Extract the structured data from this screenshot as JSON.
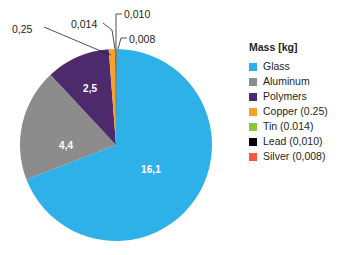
{
  "chart_data": {
    "type": "pie",
    "title": "",
    "legend_title": "Mass [kg]",
    "legend_position": "right",
    "units": "kg",
    "decimal_separator": ",",
    "total": 23.272,
    "categories": [
      "Glass",
      "Aluminum",
      "Polymers",
      "Copper",
      "Tin",
      "Lead",
      "Silver"
    ],
    "values": [
      16.1,
      4.4,
      2.5,
      0.25,
      0.014,
      0.01,
      0.008
    ],
    "colors": [
      "#2EB0E8",
      "#8C8C8C",
      "#4D2A6B",
      "#F5A22B",
      "#8CC63E",
      "#000000",
      "#F15B3C"
    ],
    "slices": [
      {
        "name": "Glass",
        "value": 16.1,
        "display_value": "16,1",
        "color": "#2EB0E8",
        "legend_label": "Glass",
        "label_placement": "inside",
        "start_angle": 0.0,
        "sweep_angle": 249.0
      },
      {
        "name": "Aluminum",
        "value": 4.4,
        "display_value": "4,4",
        "color": "#8C8C8C",
        "legend_label": "Aluminum",
        "label_placement": "inside",
        "start_angle": 249.0,
        "sweep_angle": 68.1
      },
      {
        "name": "Polymers",
        "value": 2.5,
        "display_value": "2,5",
        "color": "#4D2A6B",
        "legend_label": "Polymers",
        "label_placement": "inside",
        "start_angle": 317.1,
        "sweep_angle": 38.7
      },
      {
        "name": "Copper",
        "value": 0.25,
        "display_value": "0,25",
        "color": "#F5A22B",
        "legend_label": "Copper (0.25)",
        "label_placement": "callout",
        "start_angle": 355.8,
        "sweep_angle": 3.87
      },
      {
        "name": "Tin",
        "value": 0.014,
        "display_value": "0,014",
        "color": "#8CC63E",
        "legend_label": "Tin (0.014)",
        "label_placement": "callout",
        "start_angle": 359.67,
        "sweep_angle": 0.217
      },
      {
        "name": "Lead",
        "value": 0.01,
        "display_value": "0,010",
        "color": "#000000",
        "legend_label": "Lead (0,010)",
        "label_placement": "callout",
        "start_angle": 359.887,
        "sweep_angle": 0.155
      },
      {
        "name": "Silver",
        "value": 0.008,
        "display_value": "0,008",
        "color": "#F15B3C",
        "legend_label": "Silver (0,008)",
        "label_placement": "callout",
        "start_angle": 0.0,
        "sweep_angle": 0.124
      }
    ],
    "inside_labels": [
      "16,1",
      "4,4",
      "2,5"
    ],
    "callout_labels": [
      "0,25",
      "0,014",
      "0,010",
      "0,008"
    ]
  },
  "pie": {
    "center_x": 116,
    "center_y": 145,
    "radius": 96,
    "inside_labels": [
      {
        "text": "16,1",
        "x": 141,
        "y": 164,
        "name": "glass"
      },
      {
        "text": "4,4",
        "x": 59,
        "y": 140,
        "name": "aluminum"
      },
      {
        "text": "2,5",
        "x": 83,
        "y": 83,
        "name": "polymers"
      }
    ],
    "callouts": [
      {
        "text": "0,25",
        "x": 12,
        "y": 23,
        "name": "copper"
      },
      {
        "text": "0,014",
        "x": 71,
        "y": 18,
        "name": "tin"
      },
      {
        "text": "0,010",
        "x": 124,
        "y": 8,
        "name": "lead"
      },
      {
        "text": "0,008",
        "x": 129,
        "y": 33,
        "name": "silver"
      }
    ]
  },
  "legend": {
    "title": "Mass [kg]",
    "items": [
      {
        "label": "Glass",
        "color": "#2EB0E8"
      },
      {
        "label": "Aluminum",
        "color": "#8C8C8C"
      },
      {
        "label": "Polymers",
        "color": "#4D2A6B"
      },
      {
        "label": "Copper (0.25)",
        "color": "#F5A22B"
      },
      {
        "label": "Tin (0.014)",
        "color": "#8CC63E"
      },
      {
        "label": "Lead (0,010)",
        "color": "#000000"
      },
      {
        "label": "Silver (0,008)",
        "color": "#F15B3C"
      }
    ]
  }
}
